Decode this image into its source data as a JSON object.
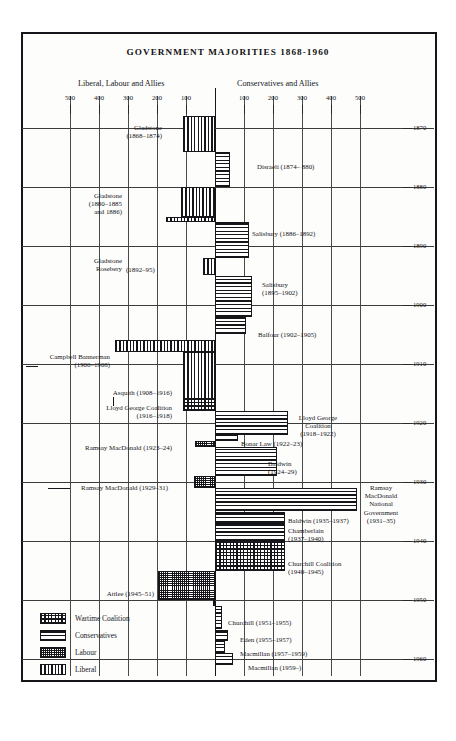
{
  "chart_data": {
    "type": "bar",
    "title": "GOVERNMENT MAJORITIES 1868-1960",
    "subtitle_left": "Liberal, Labour and Allies",
    "subtitle_right": "Conservatives and Allies",
    "xlabel": "",
    "ylabel": "",
    "orientation": "horizontal-diverging-timeline",
    "grid": true,
    "legend_position": "bottom-left",
    "xlim": [
      -560,
      560
    ],
    "ylim": [
      1866,
      1962
    ],
    "x_ticks_left": [
      "500",
      "400",
      "300",
      "200",
      "100"
    ],
    "x_ticks_right": [
      "100",
      "200",
      "300",
      "400",
      "500"
    ],
    "y_ticks": [
      "1870",
      "1880",
      "1890",
      "1900",
      "1910",
      "1920",
      "1930",
      "1940",
      "1950",
      "1960"
    ],
    "series": [
      {
        "name": "Liberal",
        "pattern": "vertical-lines"
      },
      {
        "name": "Conservatives",
        "pattern": "horizontal-lines"
      },
      {
        "name": "Labour",
        "pattern": "fine-stipple"
      },
      {
        "name": "Wartime Coalition",
        "pattern": "cross-hatch"
      }
    ],
    "bars": [
      {
        "label": "Gladstone\n(1868-1874)",
        "party": "liberal",
        "side": "left",
        "majority": 112,
        "start": 1868,
        "end": 1874
      },
      {
        "label": "Disraeli (1874- 880)",
        "party": "cons",
        "side": "right",
        "majority": 50,
        "start": 1874,
        "end": 1880
      },
      {
        "label": "Gladstone\n(1880-1885\nand 1886)",
        "party": "liberal",
        "side": "left",
        "majority": 118,
        "start": 1880,
        "end": 1885
      },
      {
        "label": "",
        "party": "liberal",
        "side": "left",
        "majority": 170,
        "start": 1885,
        "end": 1886
      },
      {
        "label": "Salisbury (1886-1892)",
        "party": "cons",
        "side": "right",
        "majority": 118,
        "start": 1886,
        "end": 1892
      },
      {
        "label": "Gladstone\nRosebery  (1892-95)",
        "party": "liberal",
        "side": "left",
        "majority": 40,
        "start": 1892,
        "end": 1895
      },
      {
        "label": "Salisbury\n(1895-1902)",
        "party": "cons",
        "side": "right",
        "majority": 128,
        "start": 1895,
        "end": 1902
      },
      {
        "label": "Balfour (1902-1905)",
        "party": "cons",
        "side": "right",
        "majority": 108,
        "start": 1902,
        "end": 1905
      },
      {
        "label": "Campbell Bannerman\n(1906-1908)",
        "party": "liberal",
        "side": "left",
        "majority": 345,
        "start": 1906,
        "end": 1908
      },
      {
        "label": "Asquith (1908-1916)",
        "party": "liberal",
        "side": "left",
        "majority": 112,
        "start": 1908,
        "end": 1916
      },
      {
        "label": "Lloyd George Coalition\n(1916-1918)",
        "party": "wartime",
        "side": "left",
        "majority": 112,
        "start": 1916,
        "end": 1918
      },
      {
        "label": "Lloyd George\nCoalition\n(1918-1922)",
        "party": "cons",
        "side": "right",
        "majority": 250,
        "start": 1918,
        "end": 1922
      },
      {
        "label": "Bonar Law (1922-23)",
        "party": "cons",
        "side": "right",
        "majority": 80,
        "start": 1922,
        "end": 1923
      },
      {
        "label": "Ramsay MacDonald  (1923-24)",
        "party": "labour",
        "side": "left",
        "majority": 68,
        "start": 1923,
        "end": 1924
      },
      {
        "label": "Baldwin\n(1924-29)",
        "party": "cons",
        "side": "right",
        "majority": 215,
        "start": 1924,
        "end": 1929
      },
      {
        "label": "Ramsay MacDonald (1929-31)",
        "party": "labour",
        "side": "left",
        "majority": 72,
        "start": 1929,
        "end": 1931
      },
      {
        "label": "Ramsay\nMacDonald\nNational\nGovernment\n(1931-35)",
        "party": "cons",
        "side": "right",
        "majority": 490,
        "start": 1931,
        "end": 1935
      },
      {
        "label": "Baldwin (1935-1937)",
        "party": "cons",
        "side": "right",
        "majority": 240,
        "start": 1935,
        "end": 1937
      },
      {
        "label": "Chamberlain\n(1937-1940)",
        "party": "cons",
        "side": "right",
        "majority": 240,
        "start": 1937,
        "end": 1940
      },
      {
        "label": "Churchill Coalition\n(1940-1945)",
        "party": "wartime",
        "side": "right",
        "majority": 240,
        "start": 1940,
        "end": 1945
      },
      {
        "label": "Attlee (1945-51)",
        "party": "labour",
        "side": "left",
        "majority": 195,
        "start": 1945,
        "end": 1950
      },
      {
        "label": "",
        "party": "labour",
        "side": "left",
        "majority": 8,
        "start": 1950,
        "end": 1951
      },
      {
        "label": "Churchill (1951-1955)",
        "party": "cons",
        "side": "right",
        "majority": 25,
        "start": 1951,
        "end": 1955
      },
      {
        "label": "Eden (1955-1957)",
        "party": "cons",
        "side": "right",
        "majority": 45,
        "start": 1955,
        "end": 1957
      },
      {
        "label": "Macmillan (1957-1959)",
        "party": "cons",
        "side": "right",
        "majority": 33,
        "start": 1957,
        "end": 1959
      },
      {
        "label": "Macmillan (1959-)",
        "party": "cons",
        "side": "right",
        "majority": 62,
        "start": 1959,
        "end": 1961
      }
    ]
  },
  "legend": {
    "items": [
      {
        "label": "Wartime  Coalition",
        "pattern": "wartime"
      },
      {
        "label": "Conservatives",
        "pattern": "cons"
      },
      {
        "label": "Labour",
        "pattern": "labour"
      },
      {
        "label": "Liberal",
        "pattern": "liberal"
      }
    ]
  },
  "annotations": {
    "gladstone_1": "Gladstone",
    "gladstone_1_years": "(1868–1874)",
    "disraeli": "Disraeli (1874– 880)",
    "gladstone_2": "Gladstone",
    "gladstone_2_years": "(1880–1885",
    "gladstone_2_years_b": "and 1886)",
    "salisbury_1": "Salisbury (1886–1892)",
    "glad_rosebery_a": "Gladstone",
    "glad_rosebery_b": "Rosebery",
    "glad_rosebery_years": "(1892–95)",
    "salisbury_2": "Salisbury",
    "salisbury_2_years": "(1895–1902)",
    "balfour": "Balfour (1902–1905)",
    "campbell": "Campbell Bannerman",
    "campbell_years": "(1906–1908)",
    "asquith": "Asquith (1908–1916)",
    "lloyd_coal": "Lloyd George Coalition",
    "lloyd_coal_years": "(1916–1918)",
    "lloyd_r_a": "Lloyd George",
    "lloyd_r_b": "Coalition",
    "lloyd_r_c": "(1918–1922)",
    "bonar": "Bonar Law (1922–23)",
    "macdonald_1": "Ramsay MacDonald  (1923–24)",
    "baldwin_1": "Baldwin",
    "baldwin_1_years": "(1924–29)",
    "macdonald_2": "Ramsay MacDonald (1929–31)",
    "natgov_a": "Ramsay",
    "natgov_b": "MacDonald",
    "natgov_c": "National",
    "natgov_d": "Government",
    "natgov_e": "(1931–35)",
    "baldwin_2": "Baldwin (1935–1937)",
    "chamberlain": "Chamberlain",
    "chamberlain_years": "(1937–1940)",
    "churchill_coal": "Churchill Coalition",
    "churchill_coal_years": "(1940–1945)",
    "attlee": "Attlee (1945–51)",
    "churchill": "Churchill (1951–1955)",
    "eden": "Eden (1955–1957)",
    "macmillan_1": "Macmillan (1957–1959)",
    "macmillan_2": "Macmillan (1959–)"
  }
}
